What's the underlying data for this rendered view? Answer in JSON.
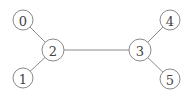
{
  "diagram": {
    "type": "graph",
    "nodes": [
      {
        "id": "0",
        "label": "0",
        "x": 23,
        "y": 20,
        "r": 10
      },
      {
        "id": "1",
        "label": "1",
        "x": 23,
        "y": 78,
        "r": 10
      },
      {
        "id": "2",
        "label": "2",
        "x": 53,
        "y": 50,
        "r": 11
      },
      {
        "id": "3",
        "label": "3",
        "x": 140,
        "y": 50,
        "r": 11
      },
      {
        "id": "4",
        "label": "4",
        "x": 170,
        "y": 20,
        "r": 10
      },
      {
        "id": "5",
        "label": "5",
        "x": 170,
        "y": 79,
        "r": 10
      }
    ],
    "edges": [
      {
        "from": "0",
        "to": "2"
      },
      {
        "from": "1",
        "to": "2"
      },
      {
        "from": "2",
        "to": "3"
      },
      {
        "from": "3",
        "to": "4"
      },
      {
        "from": "3",
        "to": "5"
      }
    ]
  }
}
